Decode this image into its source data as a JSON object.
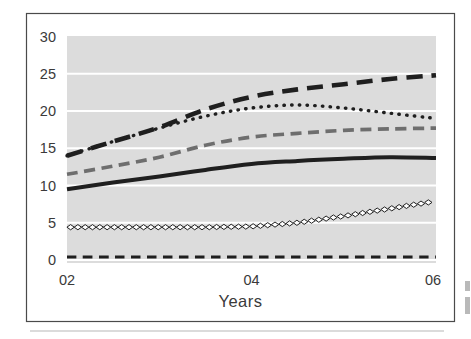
{
  "figure": {
    "x_axis_title": "Years"
  },
  "colors": {
    "page_bg": "#ffffff",
    "plot_bg": "#dcdcdc",
    "grid": "#ffffff",
    "frame_border": "#4a4a4a",
    "text": "#3a3a3a",
    "series_black": "#1f1f1f",
    "series_gray": "#6e6e6e",
    "diamond_fill": "#ffffff"
  },
  "chart_data": {
    "type": "line",
    "title": "",
    "xlabel": "Years",
    "ylabel": "",
    "xlim": [
      2,
      6
    ],
    "ylim": [
      0,
      30
    ],
    "x_ticks": [
      {
        "label": "02",
        "value": 2
      },
      {
        "label": "04",
        "value": 4
      },
      {
        "label": "06",
        "value": 6
      }
    ],
    "y_ticks": [
      0,
      5,
      10,
      15,
      20,
      25,
      30
    ],
    "grid": "horizontal-white-on-gray",
    "legend": "none",
    "x": [
      2,
      2.5,
      3,
      3.5,
      4,
      4.5,
      5,
      5.5,
      6
    ],
    "series": [
      {
        "name": "series-1-bold-long-dash",
        "style": "bold-long-dash",
        "color": "#1f1f1f",
        "values": [
          14.0,
          15.9,
          17.8,
          20.2,
          21.9,
          22.9,
          23.6,
          24.3,
          24.8
        ]
      },
      {
        "name": "series-2-dotted",
        "style": "dotted",
        "color": "#1f1f1f",
        "values": [
          14.0,
          15.9,
          17.7,
          19.3,
          20.4,
          20.8,
          20.4,
          19.7,
          19.0
        ]
      },
      {
        "name": "series-3-gray-dash",
        "style": "gray-dash",
        "color": "#6e6e6e",
        "values": [
          11.5,
          12.6,
          13.8,
          15.4,
          16.5,
          17.0,
          17.4,
          17.6,
          17.7
        ]
      },
      {
        "name": "series-4-solid",
        "style": "solid",
        "color": "#1f1f1f",
        "values": [
          9.5,
          10.4,
          11.2,
          12.1,
          12.9,
          13.3,
          13.6,
          13.8,
          13.7
        ]
      },
      {
        "name": "series-5-diamond-chain",
        "style": "diamond-chain",
        "color": "#1f1f1f",
        "values": [
          4.4,
          4.4,
          4.4,
          4.4,
          4.5,
          5.0,
          5.9,
          6.9,
          7.9
        ]
      },
      {
        "name": "series-6-short-dash",
        "style": "short-dash",
        "color": "#1f1f1f",
        "values": [
          0.4,
          0.4,
          0.4,
          0.4,
          0.4,
          0.4,
          0.4,
          0.4,
          0.4
        ]
      }
    ]
  }
}
